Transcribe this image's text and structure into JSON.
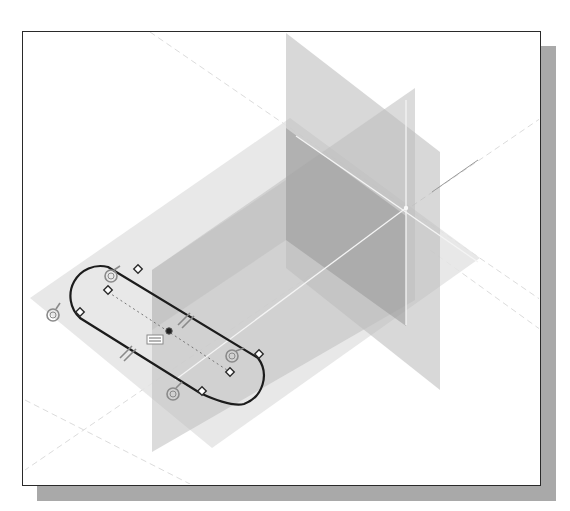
{
  "figure": {
    "colors": {
      "background": "#ffffff",
      "frame_border": "#2a2a2a",
      "frame_shadow": "#a9a9a9",
      "plane_light": "#e6e6e6",
      "plane_mid": "#c4c4c4",
      "plane_dark": "#9a9a9a",
      "sketch_line": "#1c1c1c",
      "axis_line": "#f2f2f2"
    }
  },
  "scene": {
    "planes": [
      {
        "name": "horizontal-datum-plane",
        "role": "sketch plane"
      },
      {
        "name": "vertical-datum-plane-back",
        "role": "reference plane"
      },
      {
        "name": "vertical-datum-plane-front",
        "role": "reference plane"
      }
    ],
    "sketch": {
      "profile": "slot",
      "constraint_icons": [
        {
          "type": "tangent",
          "count": 4
        },
        {
          "type": "parallel",
          "count": 2
        },
        {
          "type": "coincident-point",
          "count": 6
        },
        {
          "type": "equal",
          "count": 1
        },
        {
          "type": "center-point",
          "count": 3
        }
      ]
    }
  }
}
